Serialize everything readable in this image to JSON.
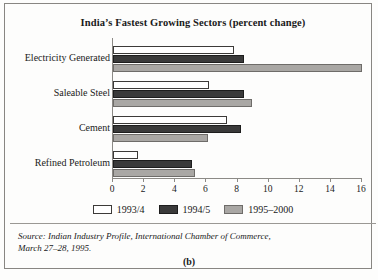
{
  "figure": {
    "panel_label": "(b)",
    "source_lines": [
      "Source: Indian Industry Profile, International Chamber of Commerce,",
      "March 27–28, 1995."
    ]
  },
  "chart_data": {
    "type": "bar",
    "orientation": "horizontal",
    "title": "India’s Fastest Growing Sectors (percent change)",
    "xlabel": "",
    "ylabel": "",
    "xlim": [
      0,
      16
    ],
    "xticks": [
      0,
      2,
      4,
      6,
      8,
      10,
      12,
      14,
      16
    ],
    "xtick_labels": [
      "0",
      "2",
      "4",
      "6",
      "8",
      "10",
      "12",
      "14",
      "16"
    ],
    "grid": false,
    "legend_position": "bottom",
    "categories": [
      "Electricity Generated",
      "Saleable Steel",
      "Cement",
      "Refined Petroleum"
    ],
    "series": [
      {
        "name": "1993/4",
        "color": "#ffffff",
        "values": [
          7.8,
          6.2,
          7.3,
          1.6
        ]
      },
      {
        "name": "1994/5",
        "color": "#3a3a3a",
        "values": [
          8.4,
          8.4,
          8.2,
          5.1
        ]
      },
      {
        "name": "1995–2000",
        "color": "#a9a7a4",
        "values": [
          16.0,
          8.9,
          6.1,
          5.3
        ]
      }
    ]
  }
}
